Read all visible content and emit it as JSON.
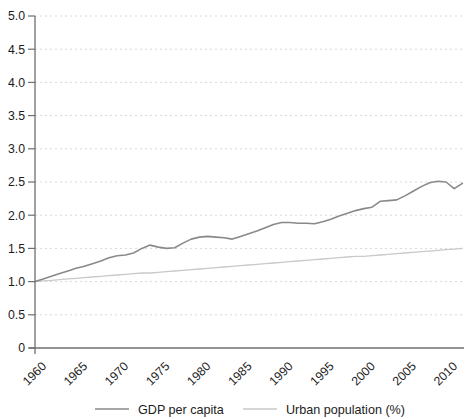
{
  "chart_data": {
    "type": "line",
    "title": "",
    "xlabel": "",
    "ylabel": "",
    "xlim": [
      1960,
      2012
    ],
    "ylim": [
      0,
      5
    ],
    "grid": "horizontal-dashed",
    "legend_position": "bottom-center",
    "x": [
      1960,
      1961,
      1962,
      1963,
      1964,
      1965,
      1966,
      1967,
      1968,
      1969,
      1970,
      1971,
      1972,
      1973,
      1974,
      1975,
      1976,
      1977,
      1978,
      1979,
      1980,
      1981,
      1982,
      1983,
      1984,
      1985,
      1986,
      1987,
      1988,
      1989,
      1990,
      1991,
      1992,
      1993,
      1994,
      1995,
      1996,
      1997,
      1998,
      1999,
      2000,
      2001,
      2002,
      2003,
      2004,
      2005,
      2006,
      2007,
      2008,
      2009,
      2010,
      2011,
      2012
    ],
    "series": [
      {
        "name": "GDP per capita",
        "color": "#898989",
        "width": 1.6,
        "values": [
          1.0,
          1.04,
          1.08,
          1.12,
          1.16,
          1.2,
          1.23,
          1.27,
          1.31,
          1.36,
          1.39,
          1.4,
          1.43,
          1.5,
          1.55,
          1.52,
          1.5,
          1.51,
          1.58,
          1.64,
          1.67,
          1.68,
          1.67,
          1.66,
          1.64,
          1.68,
          1.72,
          1.76,
          1.81,
          1.86,
          1.89,
          1.89,
          1.88,
          1.88,
          1.87,
          1.9,
          1.94,
          1.99,
          2.03,
          2.07,
          2.1,
          2.12,
          2.21,
          2.22,
          2.23,
          2.29,
          2.36,
          2.43,
          2.49,
          2.51,
          2.5,
          2.4,
          2.48
        ]
      },
      {
        "name": "Urban population (%)",
        "color": "#c9c9c9",
        "width": 1.3,
        "values": [
          1.0,
          1.01,
          1.02,
          1.03,
          1.04,
          1.05,
          1.06,
          1.07,
          1.08,
          1.09,
          1.1,
          1.11,
          1.12,
          1.13,
          1.13,
          1.14,
          1.15,
          1.16,
          1.17,
          1.18,
          1.19,
          1.2,
          1.21,
          1.22,
          1.23,
          1.24,
          1.25,
          1.26,
          1.27,
          1.28,
          1.29,
          1.3,
          1.31,
          1.32,
          1.33,
          1.34,
          1.35,
          1.36,
          1.37,
          1.38,
          1.38,
          1.39,
          1.4,
          1.41,
          1.42,
          1.43,
          1.44,
          1.45,
          1.46,
          1.47,
          1.48,
          1.49,
          1.5
        ]
      }
    ],
    "x_ticks": [
      "1960",
      "1965",
      "1970",
      "1975",
      "1980",
      "1985",
      "1990",
      "1995",
      "2000",
      "2005",
      "2010"
    ],
    "x_tick_values": [
      1960,
      1965,
      1970,
      1975,
      1980,
      1985,
      1990,
      1995,
      2000,
      2005,
      2010
    ],
    "y_ticks": [
      "5.0",
      "4.5",
      "4.0",
      "3.5",
      "3.0",
      "2.5",
      "2.0",
      "1.5",
      "1.0",
      "0.5",
      "0"
    ],
    "y_tick_values": [
      5.0,
      4.5,
      4.0,
      3.5,
      3.0,
      2.5,
      2.0,
      1.5,
      1.0,
      0.5,
      0
    ],
    "colors": {
      "grid": "#d8d8d8",
      "axis": "#6f6f6f",
      "tick": "#6f6f6f",
      "text": "#1c1c1c",
      "background": "#ffffff"
    }
  }
}
